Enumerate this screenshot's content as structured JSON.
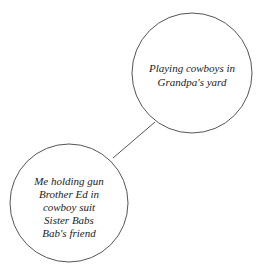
{
  "diagram": {
    "type": "mind-map",
    "colors": {
      "stroke": "#555555",
      "text": "#222222",
      "background": "#ffffff"
    },
    "nodes": [
      {
        "id": "main",
        "lines": [
          "Playing cowboys in",
          "Grandpa's yard"
        ]
      },
      {
        "id": "detail",
        "lines": [
          "Me holding gun",
          "Brother Ed in",
          "cowboy suit",
          "Sister Babs",
          "Bab's friend"
        ]
      }
    ],
    "edges": [
      {
        "from": "main",
        "to": "detail"
      }
    ]
  }
}
